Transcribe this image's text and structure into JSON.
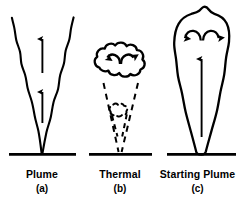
{
  "figure": {
    "background_color": "#ffffff",
    "stroke_color": "#000000",
    "type": "scientific-line-diagram"
  },
  "panels": [
    {
      "id": "a",
      "title": "Plume",
      "sublabel": "(a)",
      "shape": "narrow-upward-widening-conduit",
      "arrows": 2,
      "arrow_direction": "up",
      "arrow_style": "straight-solid",
      "outline_style": "solid",
      "has_baseline": true
    },
    {
      "id": "b",
      "title": "Thermal",
      "sublabel": "(b)",
      "shape": "cloud-head-on-dashed-cone",
      "arrows": 2,
      "arrow_direction": "inward-down-curved",
      "arrow_style": "curved-solid",
      "outline_style": "solid-head-dashed-tail",
      "has_baseline": true
    },
    {
      "id": "c",
      "title": "Starting Plume",
      "sublabel": "(c)",
      "shape": "bulbous-head-with-tapered-stem",
      "arrows": 3,
      "arrow_direction": "outward-down-curved-plus-central-up",
      "arrow_style": "curved-and-straight-solid",
      "outline_style": "solid",
      "has_baseline": true
    }
  ],
  "captions": {
    "a": {
      "title": "Plume",
      "sub": "(a)"
    },
    "b": {
      "title": "Thermal",
      "sub": "(b)"
    },
    "c": {
      "title": "Starting Plume",
      "sub": "(c)"
    }
  },
  "colors": {
    "stroke": "#000000",
    "background": "#ffffff",
    "text": "#000000"
  }
}
